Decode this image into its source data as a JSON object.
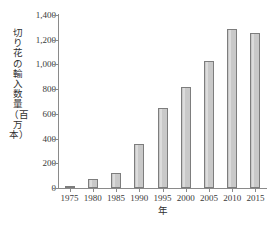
{
  "chart_data": {
    "type": "bar",
    "title": "",
    "subtitle": "",
    "xlabel": "年",
    "ylabel": "切り花の輸入数量（百万本）",
    "categories": [
      "1975",
      "1980",
      "1985",
      "1990",
      "1995",
      "2000",
      "2005",
      "2010",
      "2015"
    ],
    "values": [
      15,
      75,
      120,
      355,
      650,
      815,
      1025,
      1290,
      1255
    ],
    "series": [
      {
        "name": "切り花の輸入数量",
        "values": [
          15,
          75,
          120,
          355,
          650,
          815,
          1025,
          1290,
          1255
        ]
      }
    ],
    "ylim": [
      0,
      1400
    ],
    "ytick_values": [
      0,
      200,
      400,
      600,
      800,
      1000,
      1200,
      1400
    ],
    "ytick_labels": [
      "0",
      "200",
      "400",
      "600",
      "800",
      "1,000",
      "1,200",
      "1,400"
    ],
    "xtick_labels": [
      "1975",
      "1980",
      "1985",
      "1990",
      "1995",
      "2000",
      "2005",
      "2010",
      "2015"
    ],
    "grid": false,
    "legend": false,
    "legend_position": "none",
    "bar_fill_color": "#c9c9c9",
    "bar_edge_color": "#7d7d7d",
    "axis_color": "#8a8a8a",
    "background_color": "#ffffff",
    "unit_note": "百万本"
  },
  "axes": {
    "y_title": "切り花の輸入数量（百万本）",
    "x_title": "年"
  }
}
